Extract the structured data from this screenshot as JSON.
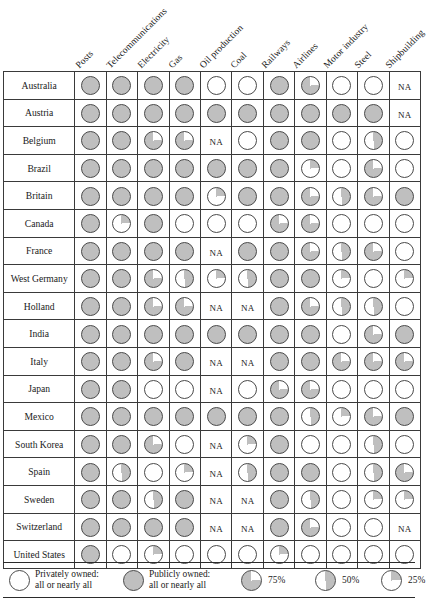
{
  "chart_data": {
    "type": "heatmap",
    "xlabel": "",
    "ylabel": "",
    "grid": true,
    "legend_position": "bottom",
    "value_scale": {
      "100": "Publicly owned: all or nearly all",
      "75": "75%",
      "50": "50%",
      "25": "25%",
      "0": "Privately owned: all or nearly all",
      "NA": "Not applicable"
    },
    "categories": [
      "Posts",
      "Telecommunications",
      "Electricity",
      "Gas",
      "Oil production",
      "Coal",
      "Railways",
      "Airlines",
      "Motor industry",
      "Steel",
      "Shipbuilding"
    ],
    "rows": [
      {
        "name": "Australia",
        "values": [
          100,
          100,
          100,
          100,
          0,
          0,
          100,
          75,
          0,
          0,
          "NA"
        ]
      },
      {
        "name": "Austria",
        "values": [
          100,
          100,
          100,
          100,
          100,
          100,
          100,
          100,
          100,
          100,
          "NA"
        ]
      },
      {
        "name": "Belgium",
        "values": [
          100,
          100,
          75,
          75,
          "NA",
          0,
          100,
          100,
          0,
          50,
          0
        ]
      },
      {
        "name": "Brazil",
        "values": [
          100,
          100,
          100,
          100,
          100,
          100,
          100,
          25,
          0,
          75,
          0
        ]
      },
      {
        "name": "Britain",
        "values": [
          100,
          100,
          100,
          100,
          25,
          100,
          100,
          75,
          50,
          75,
          100
        ]
      },
      {
        "name": "Canada",
        "values": [
          100,
          25,
          100,
          0,
          0,
          0,
          75,
          75,
          0,
          0,
          0
        ]
      },
      {
        "name": "France",
        "values": [
          100,
          100,
          100,
          100,
          "NA",
          100,
          100,
          75,
          50,
          75,
          0
        ]
      },
      {
        "name": "West Germany",
        "values": [
          100,
          100,
          75,
          50,
          25,
          50,
          100,
          100,
          25,
          0,
          25
        ]
      },
      {
        "name": "Holland",
        "values": [
          100,
          100,
          75,
          75,
          "NA",
          "NA",
          100,
          75,
          50,
          50,
          0
        ]
      },
      {
        "name": "India",
        "values": [
          100,
          100,
          100,
          100,
          100,
          100,
          100,
          100,
          0,
          75,
          100
        ]
      },
      {
        "name": "Italy",
        "values": [
          100,
          100,
          75,
          100,
          "NA",
          "NA",
          100,
          100,
          75,
          75,
          75
        ]
      },
      {
        "name": "Japan",
        "values": [
          100,
          100,
          0,
          0,
          "NA",
          0,
          75,
          75,
          0,
          0,
          0
        ]
      },
      {
        "name": "Mexico",
        "values": [
          100,
          100,
          100,
          100,
          100,
          100,
          100,
          50,
          25,
          75,
          100
        ]
      },
      {
        "name": "South Korea",
        "values": [
          100,
          100,
          75,
          0,
          "NA",
          25,
          100,
          0,
          0,
          50,
          0
        ]
      },
      {
        "name": "Spain",
        "values": [
          100,
          50,
          0,
          25,
          "NA",
          50,
          100,
          100,
          0,
          50,
          75
        ]
      },
      {
        "name": "Sweden",
        "values": [
          100,
          100,
          50,
          100,
          "NA",
          "NA",
          100,
          50,
          0,
          25,
          25
        ]
      },
      {
        "name": "Switzerland",
        "values": [
          100,
          100,
          100,
          100,
          "NA",
          "NA",
          100,
          75,
          0,
          0,
          "NA"
        ]
      },
      {
        "name": "United States",
        "values": [
          100,
          0,
          25,
          0,
          0,
          0,
          25,
          0,
          0,
          0,
          0
        ]
      }
    ]
  },
  "legend": {
    "private": {
      "line1": "Privately owned:",
      "line2": "all or nearly all"
    },
    "public": {
      "line1": "Publicly owned:",
      "line2": "all or nearly all"
    },
    "pct75": "75%",
    "pct50": "50%",
    "pct25": "25%"
  },
  "footer": {
    "caption": ""
  },
  "colors": {
    "fill": "#bfbfbf",
    "empty": "#ffffff",
    "rule": "#2b2b2b",
    "stroke": "#4a4a4a"
  }
}
